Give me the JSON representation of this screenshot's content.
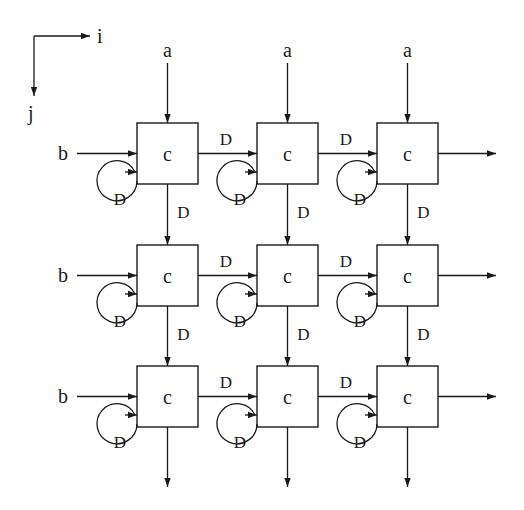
{
  "diagram": {
    "type": "systolic-array",
    "rows": 3,
    "cols": 3,
    "axis": {
      "i_label": "i",
      "j_label": "j"
    },
    "top_inputs": [
      "a",
      "a",
      "a"
    ],
    "left_inputs": [
      "b",
      "b",
      "b"
    ],
    "cell_label": "c",
    "delay_label": "D",
    "cells": [
      [
        "c",
        "c",
        "c"
      ],
      [
        "c",
        "c",
        "c"
      ],
      [
        "c",
        "c",
        "c"
      ]
    ],
    "colors": {
      "stroke": "#1a1a1a",
      "background": "#ffffff"
    }
  }
}
